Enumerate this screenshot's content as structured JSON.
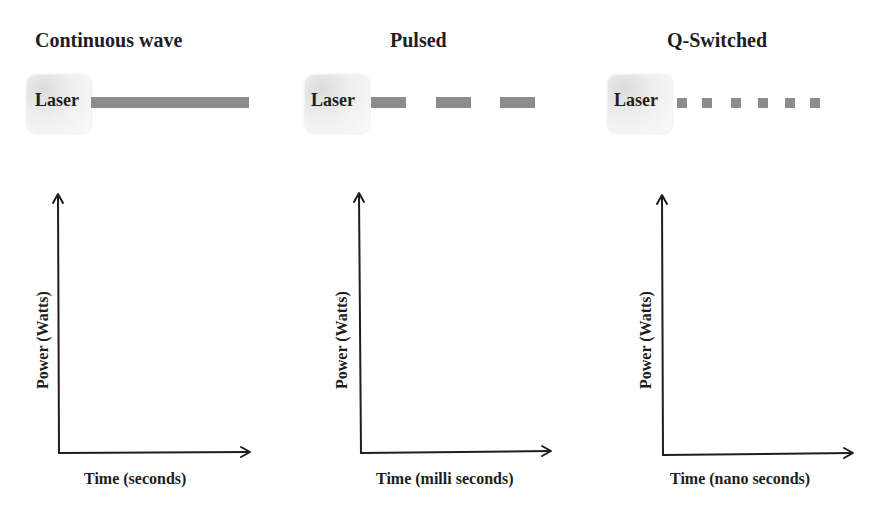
{
  "panels": [
    {
      "title": "Continuous wave",
      "laser_label": "Laser",
      "beam_type": "continuous",
      "beam_color": "#8c8c8c",
      "y_axis_label": "Power (Watts)",
      "x_axis_label": "Time (seconds)"
    },
    {
      "title": "Pulsed",
      "laser_label": "Laser",
      "beam_type": "dashes",
      "beam_segments": 3,
      "beam_color": "#8c8c8c",
      "y_axis_label": "Power (Watts)",
      "x_axis_label": "Time (milli seconds)"
    },
    {
      "title": "Q-Switched",
      "laser_label": "Laser",
      "beam_type": "dots",
      "beam_segments": 6,
      "beam_color": "#8c8c8c",
      "y_axis_label": "Power (Watts)",
      "x_axis_label": "Time (nano seconds)"
    }
  ]
}
